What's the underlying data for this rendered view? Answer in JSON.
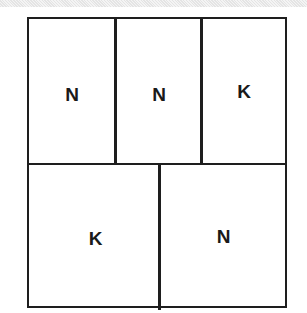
{
  "diagram": {
    "line_color": "#1e1e1e",
    "rows": [
      {
        "cells": [
          {
            "label": "N"
          },
          {
            "label": "N"
          },
          {
            "label": "K"
          }
        ]
      },
      {
        "cells": [
          {
            "label": "K"
          },
          {
            "label": "N"
          }
        ]
      }
    ]
  }
}
